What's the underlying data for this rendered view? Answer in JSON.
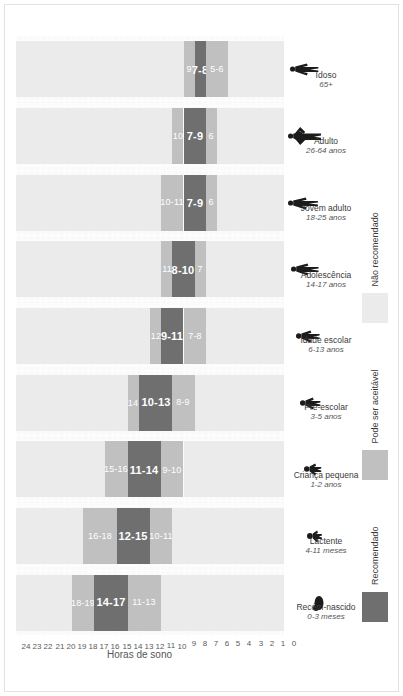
{
  "chart_data": {
    "type": "bar",
    "title": "",
    "xlabel": "",
    "ylabel": "Horas de sono",
    "ylim": [
      0,
      24
    ],
    "grid": true,
    "legend_position": "bottom-left",
    "stacked": true,
    "orientation": "vertical-bars-page-rotated-90",
    "categories": [
      "Recém-nascido",
      "Lactente",
      "Criança pequena",
      "Pré-escolar",
      "Idade escolar",
      "Adolescência",
      "Jovem adulto",
      "Adulto",
      "Idoso"
    ],
    "category_ages": [
      "0-3 meses",
      "4-11 meses",
      "1-2 anos",
      "3-5 anos",
      "6-13 anos",
      "14-17 anos",
      "18-25 anos",
      "26-64 anos",
      "65+"
    ],
    "yticks": [
      0,
      1,
      2,
      3,
      4,
      5,
      6,
      7,
      8,
      9,
      10,
      11,
      12,
      13,
      14,
      15,
      16,
      17,
      18,
      19,
      20,
      21,
      22,
      23,
      24
    ],
    "series": [
      {
        "name": "Não recomendado (alto)",
        "label_key": "not_high"
      },
      {
        "name": "Pode ser aceitável (alto)",
        "label_key": "may_high"
      },
      {
        "name": "Recomendado",
        "label_key": "recommended"
      },
      {
        "name": "Pode ser aceitável (baixo)",
        "label_key": "may_low"
      },
      {
        "name": "Não recomendado (baixo)",
        "label_key": "not_low"
      }
    ],
    "bars": [
      {
        "category": "Recém-nascido",
        "age": "0-3 meses",
        "not_low": [
          0,
          11
        ],
        "may_low": [
          11,
          14
        ],
        "recommended": [
          14,
          17
        ],
        "may_high": [
          17,
          19
        ],
        "not_high": [
          19,
          24
        ],
        "may_low_label": "11-13",
        "recommended_label": "14-17",
        "may_high_label": "18-19",
        "not_low_label": "",
        "not_high_label": ""
      },
      {
        "category": "Lactente",
        "age": "4-11 meses",
        "not_low": [
          0,
          10
        ],
        "may_low": [
          10,
          12
        ],
        "recommended": [
          12,
          15
        ],
        "may_high": [
          15,
          18
        ],
        "not_high": [
          18,
          24
        ],
        "may_low_label": "10-11",
        "recommended_label": "12-15",
        "may_high_label": "16-18",
        "not_low_label": "",
        "not_high_label": ""
      },
      {
        "category": "Criança pequena",
        "age": "1-2 anos",
        "not_low": [
          0,
          9
        ],
        "may_low": [
          9,
          11
        ],
        "recommended": [
          11,
          14
        ],
        "may_high": [
          14,
          16
        ],
        "not_high": [
          16,
          24
        ],
        "may_low_label": "9-10",
        "recommended_label": "11-14",
        "may_high_label": "15-16",
        "not_low_label": "",
        "not_high_label": ""
      },
      {
        "category": "Pré-escolar",
        "age": "3-5 anos",
        "not_low": [
          0,
          8
        ],
        "may_low": [
          8,
          10
        ],
        "recommended": [
          10,
          13
        ],
        "may_high": [
          13,
          14
        ],
        "not_high": [
          14,
          24
        ],
        "may_low_label": "8-9",
        "recommended_label": "10-13",
        "may_high_label": "14",
        "not_low_label": "",
        "not_high_label": ""
      },
      {
        "category": "Idade escolar",
        "age": "6-13 anos",
        "not_low": [
          0,
          7
        ],
        "may_low": [
          7,
          9
        ],
        "recommended": [
          9,
          11
        ],
        "may_high": [
          11,
          12
        ],
        "not_high": [
          12,
          24
        ],
        "may_low_label": "7-8",
        "recommended_label": "9-11",
        "may_high_label": "12",
        "not_low_label": "",
        "not_high_label": ""
      },
      {
        "category": "Adolescência",
        "age": "14-17 anos",
        "not_low": [
          0,
          7
        ],
        "may_low": [
          7,
          8
        ],
        "recommended": [
          8,
          10
        ],
        "may_high": [
          10,
          11
        ],
        "not_high": [
          11,
          24
        ],
        "may_low_label": "7",
        "recommended_label": "8-10",
        "may_high_label": "11",
        "not_low_label": "",
        "not_high_label": ""
      },
      {
        "category": "Jovem adulto",
        "age": "18-25 anos",
        "not_low": [
          0,
          6
        ],
        "may_low": [
          6,
          7
        ],
        "recommended": [
          7,
          9
        ],
        "may_high": [
          9,
          11
        ],
        "not_high": [
          11,
          24
        ],
        "may_low_label": "6",
        "recommended_label": "7-9",
        "may_high_label": "10-11",
        "not_low_label": "",
        "not_high_label": ""
      },
      {
        "category": "Adulto",
        "age": "26-64 anos",
        "not_low": [
          0,
          6
        ],
        "may_low": [
          6,
          7
        ],
        "recommended": [
          7,
          9
        ],
        "may_high": [
          9,
          10
        ],
        "not_high": [
          10,
          24
        ],
        "may_low_label": "6",
        "recommended_label": "7-9",
        "may_high_label": "10",
        "not_low_label": "",
        "not_high_label": ""
      },
      {
        "category": "Idoso",
        "age": "65+",
        "not_low": [
          0,
          5
        ],
        "may_low": [
          5,
          7
        ],
        "recommended": [
          7,
          8
        ],
        "may_high": [
          8,
          9
        ],
        "not_high": [
          9,
          24
        ],
        "may_low_label": "5-6",
        "recommended_label": "7-8",
        "may_high_label": "9",
        "not_low_label": "",
        "not_high_label": ""
      }
    ],
    "colors": {
      "recommended": "#6f6f6f",
      "may_be_acceptable": "#c0c0c0",
      "not_recommended": "#ebebeb",
      "plot_background": "#fafafa",
      "axis_text": "#5a5a5a"
    },
    "legend": [
      {
        "label": "Recomendado",
        "color": "#6f6f6f",
        "key": "recommended"
      },
      {
        "label": "Pode ser aceitável",
        "color": "#c0c0c0",
        "key": "may_be_acceptable"
      },
      {
        "label": "Não recomendado",
        "color": "#ebebeb",
        "key": "not_recommended"
      }
    ]
  },
  "axis": {
    "y_title": "Horas de sono"
  },
  "icons": {
    "figures": [
      "newborn-figure-icon",
      "infant-figure-icon",
      "toddler-figure-icon",
      "preschooler-figure-icon",
      "schoolchild-figure-icon",
      "teen-figure-icon",
      "young-adult-figure-icon",
      "adult-figure-icon",
      "elderly-figure-icon"
    ]
  }
}
